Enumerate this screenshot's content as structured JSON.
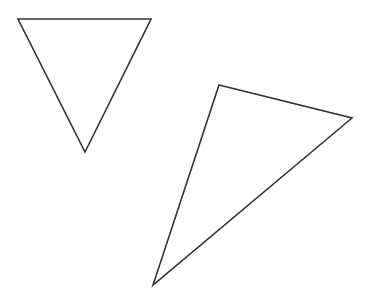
{
  "figure": {
    "shapes": [
      {
        "name": "inverted-triangle",
        "type": "triangle",
        "orientation": "pointing-down"
      },
      {
        "name": "scalene-triangle",
        "type": "triangle",
        "orientation": "rotated"
      }
    ]
  },
  "colors": {
    "stroke": "#333333",
    "background": "#ffffff"
  }
}
